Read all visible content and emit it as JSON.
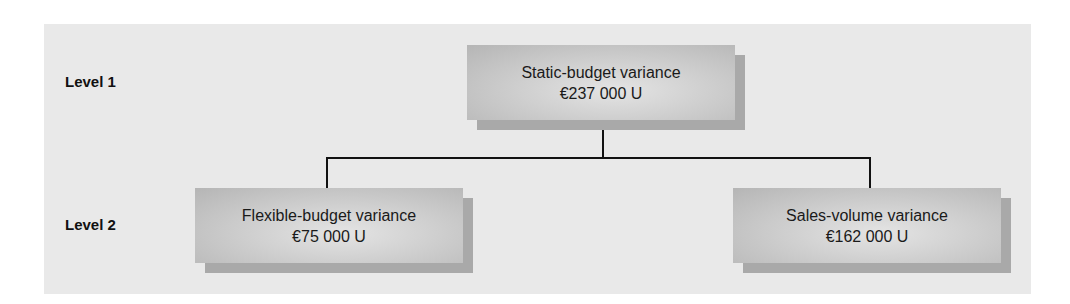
{
  "levels": [
    {
      "label": "Level 1"
    },
    {
      "label": "Level 2"
    }
  ],
  "nodes": {
    "static": {
      "title": "Static-budget variance",
      "value": "€237 000 U"
    },
    "flexible": {
      "title": "Flexible-budget variance",
      "value": "€75 000 U"
    },
    "sales_volume": {
      "title": "Sales-volume variance",
      "value": "€162 000 U"
    }
  },
  "colors": {
    "panel": "#e9e9e9",
    "box_edge": "#b5b5b5",
    "box_center": "#e4e4e4",
    "box_shadow": "#a9a9a9",
    "connector": "#111111"
  }
}
